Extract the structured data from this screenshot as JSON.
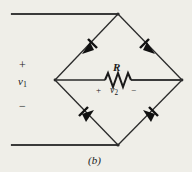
{
  "figure": {
    "caption": "(b)",
    "background_color": "#efeee8",
    "line_color": "#2a2a2a",
    "title_description": "Full-wave bridge rectifier circuit"
  },
  "labels": {
    "input_plus": "+",
    "input_voltage": "v",
    "input_voltage_subscript": "1",
    "input_minus": "−",
    "resistor": "R",
    "output_plus": "+",
    "output_voltage": "v",
    "output_voltage_subscript": "2",
    "output_minus": "−"
  },
  "nodes": {
    "top": {
      "x": 118,
      "y": 14
    },
    "bottom": {
      "x": 118,
      "y": 145
    },
    "left": {
      "x": 55,
      "y": 80
    },
    "right": {
      "x": 182,
      "y": 80
    },
    "input_lead_top_start_x": 12,
    "input_lead_bottom_start_x": 12
  },
  "components": {
    "diodes": [
      {
        "name": "diode-top-left",
        "from": "left",
        "to": "top",
        "direction": "toward-top-node"
      },
      {
        "name": "diode-top-right",
        "from": "right",
        "to": "top",
        "direction": "toward-top-node"
      },
      {
        "name": "diode-bottom-left",
        "from": "bottom",
        "to": "left",
        "direction": "toward-left-node"
      },
      {
        "name": "diode-bottom-right",
        "from": "bottom",
        "to": "right",
        "direction": "toward-right-node"
      }
    ],
    "resistor": {
      "name": "load-resistor",
      "label": "R",
      "span_x": [
        105,
        131
      ],
      "center_y": 80
    }
  },
  "wires": {
    "top_input_lead": {
      "x1": 12,
      "y1": 14,
      "x2": 118,
      "y2": 14
    },
    "bottom_input_lead": {
      "x1": 12,
      "y1": 145,
      "x2": 118,
      "y2": 145
    },
    "left_branch_upper": {
      "x1": 55,
      "y1": 80,
      "x2": 118,
      "y2": 14
    },
    "right_branch_upper": {
      "x1": 118,
      "y1": 14,
      "x2": 182,
      "y2": 80
    },
    "left_branch_lower": {
      "x1": 55,
      "y1": 80,
      "x2": 118,
      "y2": 145
    },
    "right_branch_lower": {
      "x1": 118,
      "y1": 145,
      "x2": 182,
      "y2": 80
    },
    "middle_left": {
      "x1": 55,
      "y1": 80,
      "x2": 105,
      "y2": 80
    },
    "middle_right": {
      "x1": 131,
      "y1": 80,
      "x2": 182,
      "y2": 80
    }
  }
}
